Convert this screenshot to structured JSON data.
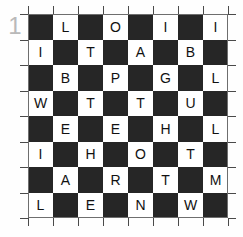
{
  "puzzle": {
    "index_label": "1",
    "grid": {
      "rows": 8,
      "columns": 8,
      "dark_color": "#262626",
      "light_color": "#ffffff",
      "letter_color": "#111111",
      "tick_color": "#4a4a4a",
      "index_color": "#b9b9b9",
      "cells": [
        [
          {
            "shade": "dark",
            "letter": ""
          },
          {
            "shade": "light",
            "letter": "L"
          },
          {
            "shade": "dark",
            "letter": ""
          },
          {
            "shade": "light",
            "letter": "O"
          },
          {
            "shade": "dark",
            "letter": ""
          },
          {
            "shade": "light",
            "letter": "I"
          },
          {
            "shade": "dark",
            "letter": ""
          },
          {
            "shade": "light",
            "letter": "I"
          }
        ],
        [
          {
            "shade": "light",
            "letter": "I"
          },
          {
            "shade": "dark",
            "letter": ""
          },
          {
            "shade": "light",
            "letter": "T"
          },
          {
            "shade": "dark",
            "letter": ""
          },
          {
            "shade": "light",
            "letter": "A"
          },
          {
            "shade": "dark",
            "letter": ""
          },
          {
            "shade": "light",
            "letter": "B"
          },
          {
            "shade": "dark",
            "letter": ""
          }
        ],
        [
          {
            "shade": "dark",
            "letter": ""
          },
          {
            "shade": "light",
            "letter": "B"
          },
          {
            "shade": "dark",
            "letter": ""
          },
          {
            "shade": "light",
            "letter": "P"
          },
          {
            "shade": "dark",
            "letter": ""
          },
          {
            "shade": "light",
            "letter": "G"
          },
          {
            "shade": "dark",
            "letter": ""
          },
          {
            "shade": "light",
            "letter": "L"
          }
        ],
        [
          {
            "shade": "light",
            "letter": "W"
          },
          {
            "shade": "dark",
            "letter": ""
          },
          {
            "shade": "light",
            "letter": "T"
          },
          {
            "shade": "dark",
            "letter": ""
          },
          {
            "shade": "light",
            "letter": "T"
          },
          {
            "shade": "dark",
            "letter": ""
          },
          {
            "shade": "light",
            "letter": "U"
          },
          {
            "shade": "dark",
            "letter": ""
          }
        ],
        [
          {
            "shade": "dark",
            "letter": ""
          },
          {
            "shade": "light",
            "letter": "E"
          },
          {
            "shade": "dark",
            "letter": ""
          },
          {
            "shade": "light",
            "letter": "E"
          },
          {
            "shade": "dark",
            "letter": ""
          },
          {
            "shade": "light",
            "letter": "H"
          },
          {
            "shade": "dark",
            "letter": ""
          },
          {
            "shade": "light",
            "letter": "L"
          }
        ],
        [
          {
            "shade": "light",
            "letter": "I"
          },
          {
            "shade": "dark",
            "letter": ""
          },
          {
            "shade": "light",
            "letter": "H"
          },
          {
            "shade": "dark",
            "letter": ""
          },
          {
            "shade": "light",
            "letter": "O"
          },
          {
            "shade": "dark",
            "letter": ""
          },
          {
            "shade": "light",
            "letter": "T"
          },
          {
            "shade": "dark",
            "letter": ""
          }
        ],
        [
          {
            "shade": "dark",
            "letter": ""
          },
          {
            "shade": "light",
            "letter": "A"
          },
          {
            "shade": "dark",
            "letter": ""
          },
          {
            "shade": "light",
            "letter": "R"
          },
          {
            "shade": "dark",
            "letter": ""
          },
          {
            "shade": "light",
            "letter": "T"
          },
          {
            "shade": "dark",
            "letter": ""
          },
          {
            "shade": "light",
            "letter": "M"
          }
        ],
        [
          {
            "shade": "light",
            "letter": "L"
          },
          {
            "shade": "dark",
            "letter": ""
          },
          {
            "shade": "light",
            "letter": "E"
          },
          {
            "shade": "dark",
            "letter": ""
          },
          {
            "shade": "light",
            "letter": "N"
          },
          {
            "shade": "dark",
            "letter": ""
          },
          {
            "shade": "light",
            "letter": "W"
          },
          {
            "shade": "dark",
            "letter": ""
          }
        ]
      ]
    }
  }
}
